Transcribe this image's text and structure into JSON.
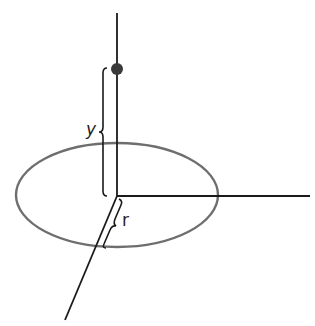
{
  "diagram": {
    "type": "cylindrical-coordinates",
    "labels": {
      "y": "y",
      "r": "r"
    },
    "elements": {
      "vertical_axis": "vertical axis",
      "horizontal_axis": "horizontal axis",
      "diagonal_axis": "diagonal axis (depth)",
      "circle": "circular path of radius r in horizontal plane",
      "point": "point at height y above origin"
    },
    "colors": {
      "axis": "#1a1a1a",
      "ellipse": "#6e6e6e",
      "point": "#3a3a3a",
      "text": "#222222"
    }
  }
}
